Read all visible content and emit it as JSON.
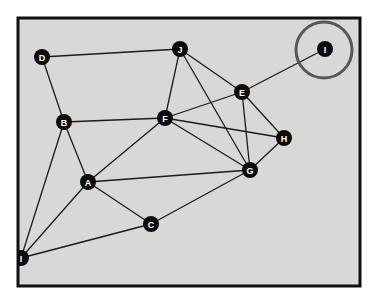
{
  "figure": {
    "kind": "undirected-graph-diagram",
    "background_color": "#ffffff",
    "canvas_color": "#d8d8d6",
    "frame_color": "#111111",
    "edge_color": "#1b1b1b",
    "node_fill": "#0c0c0c",
    "node_label_color": "#ffffff",
    "highlight_color": "#58585a",
    "frame": {
      "x": 18,
      "y": 18,
      "width": 342,
      "height": 268,
      "stroke_width": 3
    },
    "node_radius": 8,
    "edge_width": 1.3
  },
  "nodes": [
    {
      "id": "A",
      "label": "A",
      "x": 88,
      "y": 182
    },
    {
      "id": "B",
      "label": "B",
      "x": 64,
      "y": 122
    },
    {
      "id": "C",
      "label": "C",
      "x": 151,
      "y": 224
    },
    {
      "id": "D",
      "label": "D",
      "x": 42,
      "y": 57
    },
    {
      "id": "E",
      "label": "E",
      "x": 242,
      "y": 92
    },
    {
      "id": "F",
      "label": "F",
      "x": 165,
      "y": 118
    },
    {
      "id": "G",
      "label": "G",
      "x": 250,
      "y": 170
    },
    {
      "id": "H",
      "label": "H",
      "x": 284,
      "y": 138
    },
    {
      "id": "I",
      "label": "I",
      "x": 325,
      "y": 49
    },
    {
      "id": "J",
      "label": "J",
      "x": 180,
      "y": 49
    },
    {
      "id": "I2",
      "label": "I",
      "x": 21,
      "y": 258
    }
  ],
  "edges": [
    {
      "from": "D",
      "to": "J"
    },
    {
      "from": "D",
      "to": "B"
    },
    {
      "from": "B",
      "to": "F"
    },
    {
      "from": "B",
      "to": "A"
    },
    {
      "from": "A",
      "to": "F"
    },
    {
      "from": "A",
      "to": "G"
    },
    {
      "from": "A",
      "to": "C"
    },
    {
      "from": "C",
      "to": "G"
    },
    {
      "from": "J",
      "to": "F"
    },
    {
      "from": "J",
      "to": "E"
    },
    {
      "from": "J",
      "to": "G"
    },
    {
      "from": "F",
      "to": "E"
    },
    {
      "from": "F",
      "to": "H"
    },
    {
      "from": "F",
      "to": "G"
    },
    {
      "from": "E",
      "to": "G"
    },
    {
      "from": "E",
      "to": "H"
    },
    {
      "from": "E",
      "to": "I"
    },
    {
      "from": "G",
      "to": "H"
    },
    {
      "from": "I2",
      "to": "C"
    },
    {
      "from": "I2",
      "to": "A"
    },
    {
      "from": "I2",
      "to": "B"
    }
  ],
  "highlight": {
    "target_node": "I",
    "shape": "circle",
    "cx": 324,
    "cy": 50,
    "r": 28,
    "stroke_width": 3
  }
}
